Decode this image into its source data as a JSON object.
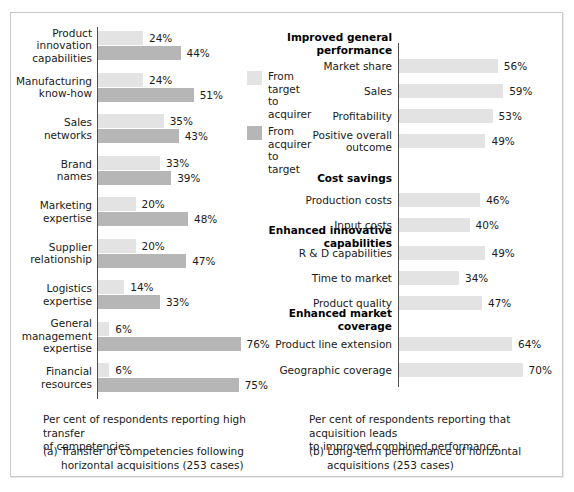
{
  "chart_data": [
    {
      "type": "bar",
      "id": "panel-a",
      "orientation": "horizontal",
      "title": "(a) Transfer of competencies following horizontal acquisitions (253 cases)",
      "xlabel": "Per cent of respondents reporting high transfer of competencies",
      "ylabel": "",
      "xlim": [
        0,
        80
      ],
      "grid": false,
      "legend_position": "right",
      "categories": [
        "Product\ninnovation\ncapabilities",
        "Manufacturing\nknow-how",
        "Sales\nnetworks",
        "Brand\nnames",
        "Marketing\nexpertise",
        "Supplier\nrelationship",
        "Logistics\nexpertise",
        "General\nmanagement\nexpertise",
        "Financial\nresources"
      ],
      "series": [
        {
          "name": "From target to acquirer",
          "color": "#e3e3e3",
          "values": [
            24,
            24,
            35,
            33,
            20,
            20,
            14,
            6,
            6
          ],
          "labels": [
            "24%",
            "24%",
            "35%",
            "33%",
            "20%",
            "20%",
            "14%",
            "6%",
            "6%"
          ]
        },
        {
          "name": "From acquirer to target",
          "color": "#b6b6b6",
          "values": [
            44,
            51,
            43,
            39,
            48,
            47,
            33,
            76,
            75
          ],
          "labels": [
            "44%",
            "51%",
            "43%",
            "39%",
            "48%",
            "47%",
            "33%",
            "76%",
            "75%"
          ]
        }
      ],
      "caption_note": "Per cent of respondents reporting high transfer of competencies",
      "caption_line1": "(a) Transfer of competencies following",
      "caption_line2": "horizontal acquisitions (253 cases)"
    },
    {
      "type": "bar",
      "id": "panel-b",
      "orientation": "horizontal",
      "title": "(b) Long-term performance of horizontal acquisitions (253 cases)",
      "xlabel": "Per cent of respondents reporting that acquisition leads to improved combined performance",
      "ylabel": "",
      "xlim": [
        0,
        80
      ],
      "grid": false,
      "legend_position": "none",
      "groups": [
        {
          "heading": "Improved general\nperformance",
          "items": [
            {
              "label": "Market share",
              "value": 56,
              "value_label": "56%"
            },
            {
              "label": "Sales",
              "value": 59,
              "value_label": "59%"
            },
            {
              "label": "Profitability",
              "value": 53,
              "value_label": "53%"
            },
            {
              "label": "Positive overall\noutcome",
              "value": 49,
              "value_label": "49%"
            }
          ]
        },
        {
          "heading": "Cost savings",
          "items": [
            {
              "label": "Production costs",
              "value": 46,
              "value_label": "46%"
            },
            {
              "label": "Input costs",
              "value": 40,
              "value_label": "40%"
            }
          ]
        },
        {
          "heading": "Enhanced innovative\ncapabilities",
          "items": [
            {
              "label": "R & D capabilities",
              "value": 49,
              "value_label": "49%"
            },
            {
              "label": "Time to market",
              "value": 34,
              "value_label": "34%"
            },
            {
              "label": "Product quality",
              "value": 47,
              "value_label": "47%"
            }
          ]
        },
        {
          "heading": "Enhanced market\ncoverage",
          "items": [
            {
              "label": "Product line extension",
              "value": 64,
              "value_label": "64%"
            },
            {
              "label": "Geographic coverage",
              "value": 70,
              "value_label": "70%"
            }
          ]
        }
      ],
      "series": [
        {
          "name": "Improved combined performance",
          "color": "#e3e3e3",
          "categories": [
            "Market share",
            "Sales",
            "Profitability",
            "Positive overall outcome",
            "Production costs",
            "Input costs",
            "R & D capabilities",
            "Time to market",
            "Product quality",
            "Product line extension",
            "Geographic coverage"
          ],
          "values": [
            56,
            59,
            53,
            49,
            46,
            40,
            49,
            34,
            47,
            64,
            70
          ]
        }
      ],
      "caption_note": "Per cent of respondents reporting that acquisition leads to improved combined performance",
      "caption_line1": "(b) Long-term performance of horizontal",
      "caption_line2": "acquisitions (253 cases)"
    }
  ],
  "panel_a": {
    "rows": [
      {
        "label": "Product\ninnovation\ncapabilities",
        "light": "24%",
        "dark": "44%"
      },
      {
        "label": "Manufacturing\nknow-how",
        "light": "24%",
        "dark": "51%"
      },
      {
        "label": "Sales\nnetworks",
        "light": "35%",
        "dark": "43%"
      },
      {
        "label": "Brand\nnames",
        "light": "33%",
        "dark": "39%"
      },
      {
        "label": "Marketing\nexpertise",
        "light": "20%",
        "dark": "48%"
      },
      {
        "label": "Supplier\nrelationship",
        "light": "20%",
        "dark": "47%"
      },
      {
        "label": "Logistics\nexpertise",
        "light": "14%",
        "dark": "33%"
      },
      {
        "label": "General\nmanagement\nexpertise",
        "light": "6%",
        "dark": "76%"
      },
      {
        "label": "Financial\nresources",
        "light": "6%",
        "dark": "75%"
      }
    ],
    "legend": [
      {
        "swatch": "light",
        "text": "From\ntarget to\nacquirer"
      },
      {
        "swatch": "dark",
        "text": "From\nacquirer\nto target"
      }
    ],
    "note": "Per cent of respondents reporting high transfer\nof competencies",
    "caption_line1": "(a) Transfer of competencies following",
    "caption_line2": "horizontal acquisitions (253 cases)"
  },
  "panel_b": {
    "headings": [
      "Improved general\nperformance",
      "Cost savings",
      "Enhanced innovative\ncapabilities",
      "Enhanced market\ncoverage"
    ],
    "rows": [
      {
        "label": "Market share",
        "value": "56%"
      },
      {
        "label": "Sales",
        "value": "59%"
      },
      {
        "label": "Profitability",
        "value": "53%"
      },
      {
        "label": "Positive overall\noutcome",
        "value": "49%"
      },
      {
        "label": "Production costs",
        "value": "46%"
      },
      {
        "label": "Input costs",
        "value": "40%"
      },
      {
        "label": "R & D capabilities",
        "value": "49%"
      },
      {
        "label": "Time to market",
        "value": "34%"
      },
      {
        "label": "Product quality",
        "value": "47%"
      },
      {
        "label": "Product line extension",
        "value": "64%"
      },
      {
        "label": "Geographic coverage",
        "value": "70%"
      }
    ],
    "note": "Per cent of respondents reporting that acquisition leads\nto improved combined performance",
    "caption_line1": "(b) Long-term performance of horizontal",
    "caption_line2": "acquisitions (253 cases)"
  },
  "colors": {
    "light_bar": "#e3e3e3",
    "dark_bar": "#b6b6b6",
    "axis": "#4d4d4d",
    "frame": "#c9c9c9",
    "text": "#1a1a1a"
  }
}
